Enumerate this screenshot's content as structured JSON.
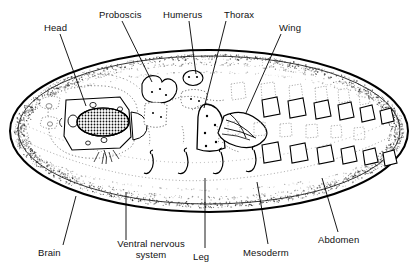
{
  "figure": {
    "colors": {
      "ink": "#000000",
      "stipple": "#4a4a4a",
      "ghost": "#9a9a9a",
      "background": "#ffffff"
    },
    "labels_top": [
      {
        "id": "head",
        "text": "Head",
        "x": 44,
        "y": 22,
        "leader": {
          "x1": 60,
          "y1": 34,
          "x2": 86,
          "y2": 106
        }
      },
      {
        "id": "proboscis",
        "text": "Proboscis",
        "x": 99,
        "y": 9,
        "leader": {
          "x1": 122,
          "y1": 21,
          "x2": 152,
          "y2": 82
        }
      },
      {
        "id": "humerus",
        "text": "Humerus",
        "x": 163,
        "y": 9,
        "leader": {
          "x1": 189,
          "y1": 21,
          "x2": 196,
          "y2": 74
        }
      },
      {
        "id": "thorax",
        "text": "Thorax",
        "x": 224,
        "y": 9,
        "leader": {
          "x1": 226,
          "y1": 21,
          "x2": 204,
          "y2": 108
        }
      },
      {
        "id": "wing",
        "text": "Wing",
        "x": 279,
        "y": 22,
        "leader": {
          "x1": 281,
          "y1": 34,
          "x2": 246,
          "y2": 113
        }
      }
    ],
    "labels_bottom": [
      {
        "id": "brain",
        "text": "Brain",
        "x": 38,
        "y": 247,
        "two_line": false,
        "leader": {
          "x1": 63,
          "y1": 245,
          "x2": 76,
          "y2": 196
        }
      },
      {
        "id": "ventral-nervous-system",
        "text": "Ventral nervous system",
        "x": 104,
        "y": 242,
        "two_line": true,
        "leader": {
          "x1": 126,
          "y1": 240,
          "x2": 126,
          "y2": 192
        }
      },
      {
        "id": "leg",
        "text": "Leg",
        "x": 193,
        "y": 251,
        "two_line": false,
        "leader": {
          "x1": 205,
          "y1": 248,
          "x2": 205,
          "y2": 178
        }
      },
      {
        "id": "mesoderm",
        "text": "Mesoderm",
        "x": 243,
        "y": 247,
        "two_line": false,
        "leader": {
          "x1": 268,
          "y1": 244,
          "x2": 257,
          "y2": 182
        }
      },
      {
        "id": "abdomen",
        "text": "Abdomen",
        "x": 318,
        "y": 234,
        "two_line": false,
        "leader": {
          "x1": 338,
          "y1": 232,
          "x2": 322,
          "y2": 178
        }
      }
    ],
    "structures": [
      {
        "id": "egg-outline",
        "name": "egg outline"
      },
      {
        "id": "blastoderm-band",
        "name": "stippled blastoderm band"
      },
      {
        "id": "brain-primordium",
        "name": "brain primordium"
      },
      {
        "id": "head-capsule",
        "name": "head capsule"
      },
      {
        "id": "proboscis-disc",
        "name": "proboscis disc"
      },
      {
        "id": "humerus-disc",
        "name": "humerus disc"
      },
      {
        "id": "thorax-disc",
        "name": "thorax disc"
      },
      {
        "id": "wing-disc",
        "name": "wing disc"
      },
      {
        "id": "leg-primordia",
        "name": "leg primordia"
      },
      {
        "id": "abdomen-segments",
        "name": "abdominal segment primordia"
      }
    ]
  }
}
